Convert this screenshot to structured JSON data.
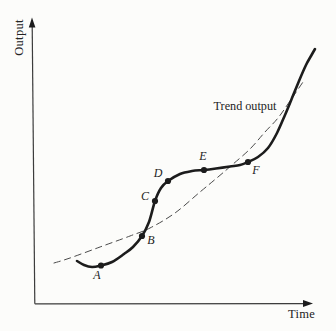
{
  "figure": {
    "background_color": "#fcfcfa",
    "ink_color": "#1c1c1c",
    "trend_line_color": "#4a4a4a",
    "axis_color": "#3c3c3c",
    "text_color": "#232323"
  },
  "chart_data": {
    "type": "line",
    "title": "",
    "xlabel": "Time",
    "ylabel": "Output",
    "grid": false,
    "axes_quantitative": false,
    "annotation": {
      "text": "Trend output",
      "x": 245,
      "y": 107
    },
    "series": [
      {
        "name": "Trend output",
        "style": "dashed",
        "color": "#4a4a4a",
        "stroke_width": 1,
        "dash_pattern": "6.5 4.5",
        "points_px": [
          [
            54,
            263
          ],
          [
            70,
            258
          ],
          [
            100,
            247
          ],
          [
            130,
            236
          ],
          [
            150,
            228
          ],
          [
            175,
            213
          ],
          [
            200,
            192
          ],
          [
            218,
            177
          ],
          [
            232,
            165
          ],
          [
            250,
            149
          ],
          [
            265,
            132
          ],
          [
            278,
            118
          ],
          [
            290,
            101
          ],
          [
            303,
            82
          ]
        ]
      },
      {
        "name": "Actual output",
        "style": "solid",
        "color": "#1c1c1c",
        "stroke_width": 2.6,
        "dash_pattern": "",
        "points_px": [
          [
            77,
            261
          ],
          [
            84,
            265
          ],
          [
            92,
            267
          ],
          [
            101,
            265.5
          ],
          [
            112,
            262
          ],
          [
            124,
            254
          ],
          [
            133,
            247
          ],
          [
            142,
            236
          ],
          [
            149,
            222
          ],
          [
            155,
            201
          ],
          [
            161,
            188
          ],
          [
            168,
            181
          ],
          [
            180,
            174
          ],
          [
            192,
            171
          ],
          [
            204,
            170
          ],
          [
            216,
            168.5
          ],
          [
            230,
            166.5
          ],
          [
            240,
            165
          ],
          [
            248,
            162
          ],
          [
            258,
            157
          ],
          [
            268,
            148
          ],
          [
            277,
            133
          ],
          [
            285,
            115
          ],
          [
            292,
            98
          ],
          [
            299,
            81
          ],
          [
            306,
            65
          ],
          [
            311,
            56
          ],
          [
            315,
            49
          ]
        ]
      }
    ],
    "markers": [
      {
        "label": "A",
        "x": 101,
        "y": 265.5,
        "label_x": 97,
        "label_y": 276
      },
      {
        "label": "B",
        "x": 142,
        "y": 236,
        "label_x": 151,
        "label_y": 241
      },
      {
        "label": "C",
        "x": 155,
        "y": 201,
        "label_x": 145,
        "label_y": 197
      },
      {
        "label": "D",
        "x": 168,
        "y": 181,
        "label_x": 158,
        "label_y": 174
      },
      {
        "label": "E",
        "x": 204,
        "y": 170,
        "label_x": 203,
        "label_y": 157
      },
      {
        "label": "F",
        "x": 248,
        "y": 162,
        "label_x": 256,
        "label_y": 171
      }
    ]
  }
}
